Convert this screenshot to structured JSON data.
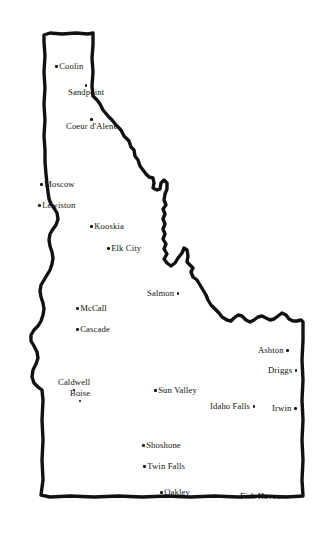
{
  "map": {
    "title": "Idaho",
    "style": "hand-drawn outline map",
    "background_color": "#ffffff",
    "outline_color": "#111111",
    "label_color": "#111111",
    "marker_color": "#111111",
    "width": 326,
    "height": 539
  },
  "cities": [
    {
      "name": "Coolin",
      "x": 55,
      "y": 62,
      "anchor": "dot-left"
    },
    {
      "name": "Sandpoint",
      "x": 68,
      "y": 84,
      "anchor": "dot-above"
    },
    {
      "name": "Coeur d'Alene",
      "x": 66,
      "y": 118,
      "anchor": "dot-above"
    },
    {
      "name": "Moscow",
      "x": 40,
      "y": 180,
      "anchor": "dot-left"
    },
    {
      "name": "Lewiston",
      "x": 38,
      "y": 201,
      "anchor": "dot-left"
    },
    {
      "name": "Kooskia",
      "x": 90,
      "y": 222,
      "anchor": "dot-left"
    },
    {
      "name": "Elk City",
      "x": 107,
      "y": 244,
      "anchor": "dot-left"
    },
    {
      "name": "Salmon",
      "x": 147,
      "y": 289,
      "anchor": "dot-right"
    },
    {
      "name": "McCall",
      "x": 76,
      "y": 304,
      "anchor": "dot-left"
    },
    {
      "name": "Cascade",
      "x": 76,
      "y": 325,
      "anchor": "dot-left"
    },
    {
      "name": "Ashton",
      "x": 258,
      "y": 346,
      "anchor": "dot-right"
    },
    {
      "name": "Driggs",
      "x": 268,
      "y": 366,
      "anchor": "dot-right"
    },
    {
      "name": "Caldwell",
      "x": 58,
      "y": 378,
      "anchor": "dot-below"
    },
    {
      "name": "Sun Valley",
      "x": 154,
      "y": 386,
      "anchor": "dot-left"
    },
    {
      "name": "Idaho Falls",
      "x": 210,
      "y": 402,
      "anchor": "dot-right"
    },
    {
      "name": "Irwin",
      "x": 272,
      "y": 404,
      "anchor": "dot-right"
    },
    {
      "name": "Boise",
      "x": 70,
      "y": 389,
      "anchor": "dot-below"
    },
    {
      "name": "Shoshone",
      "x": 142,
      "y": 441,
      "anchor": "dot-left"
    },
    {
      "name": "Twin Falls",
      "x": 143,
      "y": 462,
      "anchor": "dot-left"
    },
    {
      "name": "Oakley",
      "x": 160,
      "y": 488,
      "anchor": "dot-left"
    },
    {
      "name": "Fish Haven",
      "x": 240,
      "y": 492,
      "anchor": "dot-right"
    }
  ]
}
